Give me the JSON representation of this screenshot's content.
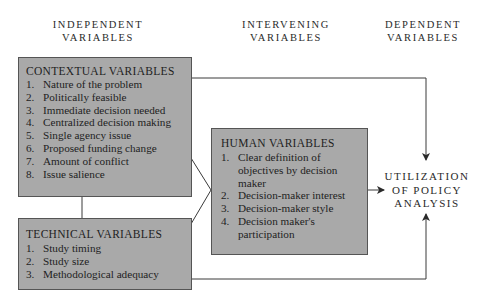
{
  "headers": {
    "independent": [
      "INDEPENDENT",
      "VARIABLES"
    ],
    "intervening": [
      "INTERVENING",
      "VARIABLES"
    ],
    "dependent": [
      "DEPENDENT",
      "VARIABLES"
    ]
  },
  "contextual": {
    "title": "CONTEXTUAL VARIABLES",
    "items": [
      {
        "num": "1.",
        "text": "Nature of the problem"
      },
      {
        "num": "2.",
        "text": "Politically feasible"
      },
      {
        "num": "3.",
        "text": "Immediate decision needed"
      },
      {
        "num": "4.",
        "text": "Centralized decision making"
      },
      {
        "num": "5.",
        "text": "Single agency issue"
      },
      {
        "num": "6.",
        "text": "Proposed funding change"
      },
      {
        "num": "7.",
        "text": "Amount of conflict"
      },
      {
        "num": "8.",
        "text": "Issue salience"
      }
    ]
  },
  "technical": {
    "title": "TECHNICAL VARIABLES",
    "items": [
      {
        "num": "1.",
        "text": "Study timing"
      },
      {
        "num": "2.",
        "text": "Study size"
      },
      {
        "num": "3.",
        "text": "Methodological adequacy"
      }
    ]
  },
  "human": {
    "title": "HUMAN VARIABLES",
    "items": [
      {
        "num": "1.",
        "text": "Clear definition of objectives by decision maker"
      },
      {
        "num": "2.",
        "text": "Decision-maker interest"
      },
      {
        "num": "3.",
        "text": "Decision-maker style"
      },
      {
        "num": "4.",
        "text": "Decision maker's participation"
      }
    ]
  },
  "outcome": {
    "lines": [
      "UTILIZATION",
      "OF POLICY",
      "ANALYSIS"
    ]
  },
  "colors": {
    "box_fill": "#a9a9a9",
    "box_border": "#555555",
    "line": "#3a3a3a",
    "text": "#1e1e1e"
  }
}
